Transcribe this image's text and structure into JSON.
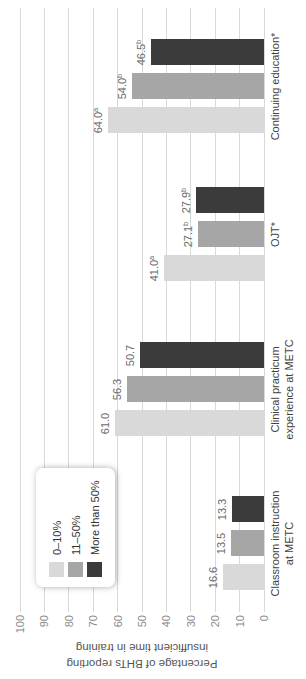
{
  "chart_data": {
    "type": "bar",
    "title": "",
    "ylabel": "Percentage of BHTs reporting insufficient time in training",
    "ylabel_lines": [
      "Percentage of BHTs reporting",
      "insufficient time in training"
    ],
    "ylim": [
      0,
      100
    ],
    "yticks": [
      0,
      10,
      20,
      30,
      40,
      50,
      60,
      70,
      80,
      90,
      100
    ],
    "grid": true,
    "orientation": "figure rotated 90deg counterclockwise into portrait",
    "legend_position": "inside-top-left",
    "categories": [
      [
        "Classroom instruction",
        "at METC"
      ],
      [
        "Clinical practicum",
        "experience at METC"
      ],
      [
        "OJT*"
      ],
      [
        "Continuing education*"
      ]
    ],
    "series": [
      {
        "name": "0–10%",
        "color": "#d9d9d9",
        "values": [
          16.6,
          61.0,
          41.0,
          64.0
        ],
        "value_labels": [
          {
            "t": "16.6",
            "sup": ""
          },
          {
            "t": "61.0",
            "sup": ""
          },
          {
            "t": "41.0",
            "sup": "a"
          },
          {
            "t": "64.0",
            "sup": "a"
          }
        ]
      },
      {
        "name": "11–50%",
        "color": "#a6a6a6",
        "values": [
          13.5,
          56.3,
          27.1,
          54.0
        ],
        "value_labels": [
          {
            "t": "13.5",
            "sup": ""
          },
          {
            "t": "56.3",
            "sup": ""
          },
          {
            "t": "27.1",
            "sup": "b"
          },
          {
            "t": "54.0",
            "sup": "b"
          }
        ]
      },
      {
        "name": "More than 50%",
        "color": "#3b3b3b",
        "values": [
          13.3,
          50.7,
          27.9,
          46.5
        ],
        "value_labels": [
          {
            "t": "13.3",
            "sup": ""
          },
          {
            "t": "50.7",
            "sup": ""
          },
          {
            "t": "27.9",
            "sup": "b"
          },
          {
            "t": "46.5",
            "sup": "b"
          }
        ]
      }
    ]
  },
  "legend": {
    "items": [
      {
        "label": "0–10%",
        "color": "#d9d9d9"
      },
      {
        "label": "11–50%",
        "color": "#a6a6a6"
      },
      {
        "label": "More than 50%",
        "color": "#3b3b3b"
      }
    ]
  }
}
